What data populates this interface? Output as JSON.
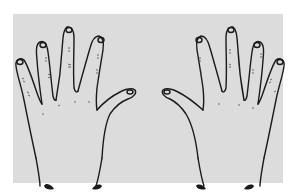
{
  "image": {
    "description": "Line drawing of the backs of two hands, left and right, fingers spread, thumbs pointing toward each other",
    "colors": {
      "background": "#ffffff",
      "panel": "#dcdcdc",
      "ink": "#1a1a1a"
    },
    "hands": [
      {
        "side": "left",
        "fingers": 5
      },
      {
        "side": "right",
        "fingers": 5
      }
    ]
  }
}
